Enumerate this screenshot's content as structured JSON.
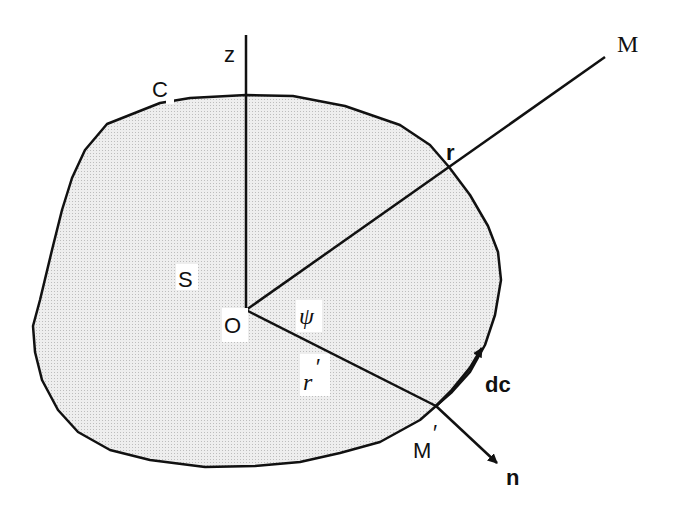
{
  "figure": {
    "type": "geometry-diagram",
    "colors": {
      "stroke": "#111111",
      "surface_fill": "#e4e4e4",
      "background": "#ffffff"
    },
    "labels": {
      "z_axis": "z",
      "contour": "C",
      "field_point": "M",
      "r_vector": "r",
      "surface": "S",
      "origin": "O",
      "angle": "ψ",
      "r_prime": "r",
      "prime_mark": "′",
      "tangent": "dc",
      "boundary_point": "M",
      "normal": "n"
    }
  }
}
